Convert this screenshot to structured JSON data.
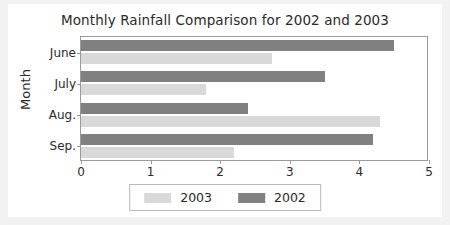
{
  "chart_data": {
    "type": "bar",
    "orientation": "horizontal",
    "title": "Monthly Rainfall Comparison for 2002 and 2003",
    "xlabel": "",
    "ylabel": "Month",
    "categories": [
      "June",
      "July",
      "Aug.",
      "Sep."
    ],
    "series": [
      {
        "name": "2003",
        "color": "#d9d9d9",
        "values": [
          2.75,
          1.8,
          4.3,
          2.2
        ]
      },
      {
        "name": "2002",
        "color": "#808080",
        "values": [
          4.5,
          3.5,
          2.4,
          4.2
        ]
      }
    ],
    "xlim": [
      0,
      5
    ],
    "xticks": [
      "0",
      "1",
      "2",
      "3",
      "4",
      "5"
    ],
    "grid": false,
    "legend_position": "bottom",
    "legend_order": [
      "2003",
      "2002"
    ]
  },
  "figure": {
    "background": "#ffffff",
    "page_background": "#f2f2f2",
    "axis_color": "#9a9a9a",
    "text_color": "#2a2a2a"
  }
}
